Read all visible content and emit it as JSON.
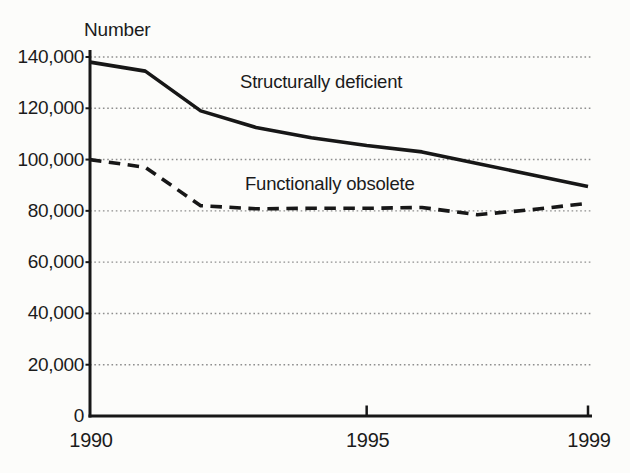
{
  "figure": {
    "y_axis_title": "Number"
  },
  "chart_data": {
    "type": "line",
    "title": "",
    "xlabel": "",
    "ylabel": "Number",
    "xlim": [
      1990,
      1999
    ],
    "ylim": [
      0,
      140000
    ],
    "grid": "horizontal dotted gridlines at each 20,000",
    "legend": "inline text labels next to lines",
    "x": [
      1990,
      1991,
      1992,
      1993,
      1994,
      1995,
      1996,
      1997,
      1998,
      1999
    ],
    "series": [
      {
        "name": "Structurally deficient",
        "line_style": "solid",
        "values": [
          138000,
          134500,
          119000,
          112500,
          108500,
          105500,
          103000,
          98500,
          94000,
          89500
        ]
      },
      {
        "name": "Functionally obsolete",
        "line_style": "dashed",
        "values": [
          100000,
          97000,
          82000,
          80800,
          81000,
          81000,
          81300,
          78500,
          80500,
          83000
        ]
      }
    ],
    "y_ticks": [
      {
        "label": "140,000",
        "value": 140000
      },
      {
        "label": "120,000",
        "value": 120000
      },
      {
        "label": "100,000",
        "value": 100000
      },
      {
        "label": "80,000",
        "value": 80000
      },
      {
        "label": "60,000",
        "value": 60000
      },
      {
        "label": "40,000",
        "value": 40000
      },
      {
        "label": "20,000",
        "value": 20000
      },
      {
        "label": "0",
        "value": 0
      }
    ],
    "x_ticks": [
      {
        "label": "1990",
        "value": 1990
      },
      {
        "label": "1995",
        "value": 1995
      },
      {
        "label": "1999",
        "value": 1999
      }
    ],
    "colors": {
      "line": "#171717",
      "grid": "#8e8e8e",
      "text": "#1b1b1b",
      "background": "#fcfcfa"
    }
  }
}
